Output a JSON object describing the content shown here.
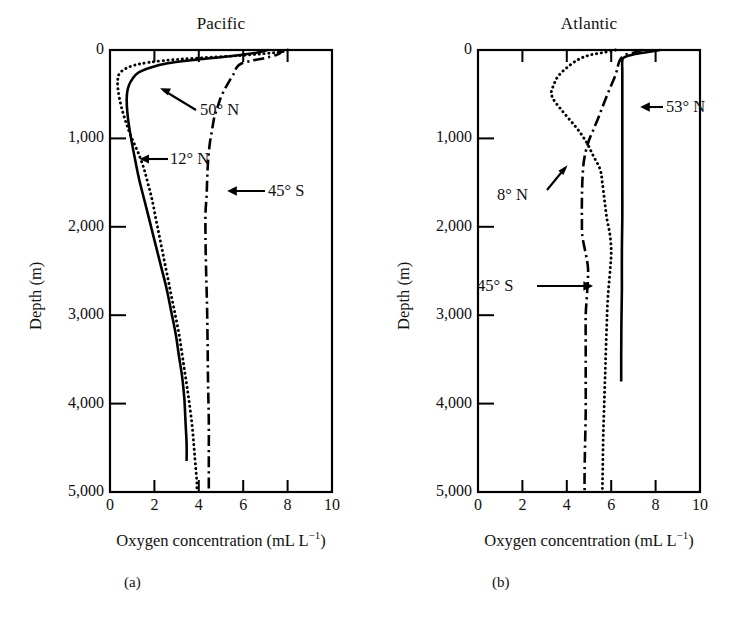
{
  "figure": {
    "panels": [
      {
        "id": "a",
        "caption": "(a)",
        "title": "Pacific",
        "xlabel_main": "Oxygen concentration (mL L",
        "xlabel_sup": "−1",
        "xlabel_tail": ")",
        "ylabel": "Depth (m)",
        "xticks": [
          "0",
          "2",
          "4",
          "6",
          "8",
          "10"
        ],
        "yticks": [
          "0",
          "1,000",
          "2,000",
          "3,000",
          "4,000",
          "5,000"
        ],
        "annotations": [
          {
            "label": "50° N",
            "target_series": "50N"
          },
          {
            "label": "12° N",
            "target_series": "12N"
          },
          {
            "label": "45° S",
            "target_series": "45S"
          }
        ]
      },
      {
        "id": "b",
        "caption": "(b)",
        "title": "Atlantic",
        "xlabel_main": "Oxygen concentration (mL L",
        "xlabel_sup": "−1",
        "xlabel_tail": ")",
        "ylabel": "Depth (m)",
        "xticks": [
          "0",
          "2",
          "4",
          "6",
          "8",
          "10"
        ],
        "yticks": [
          "0",
          "1,000",
          "2,000",
          "3,000",
          "4,000",
          "5,000"
        ],
        "annotations": [
          {
            "label": "53° N",
            "target_series": "53N"
          },
          {
            "label": "8° N",
            "target_series": "8N"
          },
          {
            "label": "45° S",
            "target_series": "45S"
          }
        ]
      }
    ]
  },
  "chart_data": [
    {
      "type": "line",
      "title": "Pacific",
      "panel": "(a)",
      "xlabel": "Oxygen concentration (mL L⁻¹)",
      "ylabel": "Depth (m)",
      "xlim": [
        0,
        10
      ],
      "ylim": [
        5000,
        0
      ],
      "y_inverted": true,
      "xticks": [
        0,
        2,
        4,
        6,
        8,
        10
      ],
      "yticks": [
        0,
        1000,
        2000,
        3000,
        4000,
        5000
      ],
      "grid": false,
      "legend": "inline annotations with leader arrows",
      "series": [
        {
          "name": "50° N",
          "style": "solid",
          "points": [
            [
              7.1,
              0
            ],
            [
              6.6,
              30
            ],
            [
              5.4,
              70
            ],
            [
              3.9,
              110
            ],
            [
              2.6,
              150
            ],
            [
              1.8,
              200
            ],
            [
              1.25,
              260
            ],
            [
              1.0,
              330
            ],
            [
              0.85,
              400
            ],
            [
              0.78,
              470
            ],
            [
              0.75,
              560
            ],
            [
              0.78,
              700
            ],
            [
              0.85,
              850
            ],
            [
              0.95,
              1000
            ],
            [
              1.1,
              1200
            ],
            [
              1.3,
              1450
            ],
            [
              1.55,
              1700
            ],
            [
              1.8,
              1950
            ],
            [
              2.05,
              2200
            ],
            [
              2.3,
              2450
            ],
            [
              2.55,
              2700
            ],
            [
              2.75,
              2950
            ],
            [
              2.95,
              3200
            ],
            [
              3.1,
              3450
            ],
            [
              3.25,
              3700
            ],
            [
              3.35,
              3950
            ],
            [
              3.4,
              4200
            ],
            [
              3.45,
              4450
            ],
            [
              3.45,
              4650
            ]
          ]
        },
        {
          "name": "12° N",
          "style": "dotted",
          "points": [
            [
              8.0,
              0
            ],
            [
              7.6,
              25
            ],
            [
              6.0,
              60
            ],
            [
              4.0,
              90
            ],
            [
              2.4,
              120
            ],
            [
              1.3,
              160
            ],
            [
              0.7,
              210
            ],
            [
              0.42,
              270
            ],
            [
              0.35,
              330
            ],
            [
              0.35,
              420
            ],
            [
              0.42,
              540
            ],
            [
              0.55,
              680
            ],
            [
              0.72,
              820
            ],
            [
              0.95,
              980
            ],
            [
              1.25,
              1150
            ],
            [
              1.5,
              1320
            ],
            [
              1.7,
              1500
            ],
            [
              1.9,
              1700
            ],
            [
              2.1,
              1950
            ],
            [
              2.3,
              2200
            ],
            [
              2.5,
              2450
            ],
            [
              2.7,
              2700
            ],
            [
              2.9,
              2950
            ],
            [
              3.1,
              3200
            ],
            [
              3.25,
              3450
            ],
            [
              3.4,
              3700
            ],
            [
              3.55,
              3950
            ],
            [
              3.7,
              4250
            ],
            [
              3.8,
              4550
            ],
            [
              3.9,
              4850
            ],
            [
              3.92,
              5000
            ]
          ]
        },
        {
          "name": "45° S",
          "style": "dash-dot",
          "points": [
            [
              7.6,
              0
            ],
            [
              7.7,
              25
            ],
            [
              7.5,
              55
            ],
            [
              7.0,
              90
            ],
            [
              6.4,
              120
            ],
            [
              5.9,
              155
            ],
            [
              5.7,
              200
            ],
            [
              5.6,
              260
            ],
            [
              5.4,
              340
            ],
            [
              5.2,
              430
            ],
            [
              5.0,
              530
            ],
            [
              4.85,
              640
            ],
            [
              4.7,
              760
            ],
            [
              4.6,
              900
            ],
            [
              4.5,
              1050
            ],
            [
              4.42,
              1250
            ],
            [
              4.38,
              1450
            ],
            [
              4.35,
              1650
            ],
            [
              4.3,
              1850
            ],
            [
              4.3,
              2100
            ],
            [
              4.32,
              2400
            ],
            [
              4.35,
              2700
            ],
            [
              4.38,
              3000
            ],
            [
              4.4,
              3400
            ],
            [
              4.42,
              3800
            ],
            [
              4.45,
              4200
            ],
            [
              4.45,
              4600
            ],
            [
              4.45,
              5000
            ]
          ]
        }
      ]
    },
    {
      "type": "line",
      "title": "Atlantic",
      "panel": "(b)",
      "xlabel": "Oxygen concentration (mL L⁻¹)",
      "ylabel": "Depth (m)",
      "xlim": [
        0,
        10
      ],
      "ylim": [
        5000,
        0
      ],
      "y_inverted": true,
      "xticks": [
        0,
        2,
        4,
        6,
        8,
        10
      ],
      "yticks": [
        0,
        1000,
        2000,
        3000,
        4000,
        5000
      ],
      "grid": false,
      "legend": "inline annotations with leader arrows",
      "series": [
        {
          "name": "53° N",
          "style": "solid",
          "points": [
            [
              8.2,
              0
            ],
            [
              7.6,
              25
            ],
            [
              7.0,
              50
            ],
            [
              6.6,
              80
            ],
            [
              6.5,
              120
            ],
            [
              6.5,
              250
            ],
            [
              6.5,
              500
            ],
            [
              6.5,
              800
            ],
            [
              6.5,
              1100
            ],
            [
              6.5,
              1500
            ],
            [
              6.5,
              1900
            ],
            [
              6.48,
              2300
            ],
            [
              6.48,
              2700
            ],
            [
              6.46,
              3100
            ],
            [
              6.45,
              3450
            ],
            [
              6.45,
              3750
            ]
          ]
        },
        {
          "name": "8° N",
          "style": "dotted",
          "points": [
            [
              6.2,
              0
            ],
            [
              5.6,
              30
            ],
            [
              5.0,
              60
            ],
            [
              4.5,
              110
            ],
            [
              4.0,
              200
            ],
            [
              3.6,
              300
            ],
            [
              3.4,
              400
            ],
            [
              3.3,
              480
            ],
            [
              3.4,
              560
            ],
            [
              3.7,
              660
            ],
            [
              4.1,
              780
            ],
            [
              4.5,
              900
            ],
            [
              4.9,
              1050
            ],
            [
              5.2,
              1200
            ],
            [
              5.5,
              1350
            ],
            [
              5.6,
              1500
            ],
            [
              5.7,
              1700
            ],
            [
              5.8,
              1900
            ],
            [
              5.95,
              2100
            ],
            [
              6.0,
              2300
            ],
            [
              5.95,
              2500
            ],
            [
              5.85,
              2800
            ],
            [
              5.8,
              3100
            ],
            [
              5.75,
              3500
            ],
            [
              5.7,
              3900
            ],
            [
              5.65,
              4300
            ],
            [
              5.62,
              4700
            ],
            [
              5.6,
              5000
            ]
          ]
        },
        {
          "name": "45° S",
          "style": "dash-dot",
          "points": [
            [
              7.4,
              0
            ],
            [
              7.0,
              30
            ],
            [
              6.6,
              60
            ],
            [
              6.4,
              110
            ],
            [
              6.3,
              180
            ],
            [
              6.2,
              280
            ],
            [
              6.0,
              400
            ],
            [
              5.8,
              520
            ],
            [
              5.6,
              650
            ],
            [
              5.4,
              780
            ],
            [
              5.2,
              900
            ],
            [
              5.0,
              1020
            ],
            [
              4.85,
              1150
            ],
            [
              4.75,
              1300
            ],
            [
              4.7,
              1500
            ],
            [
              4.68,
              1700
            ],
            [
              4.68,
              1900
            ],
            [
              4.7,
              2100
            ],
            [
              4.85,
              2300
            ],
            [
              4.95,
              2450
            ],
            [
              4.95,
              2600
            ],
            [
              4.9,
              2800
            ],
            [
              4.85,
              3000
            ],
            [
              4.85,
              3300
            ],
            [
              4.85,
              3700
            ],
            [
              4.85,
              4100
            ],
            [
              4.82,
              4500
            ],
            [
              4.8,
              4800
            ],
            [
              4.8,
              5000
            ]
          ]
        }
      ]
    }
  ]
}
